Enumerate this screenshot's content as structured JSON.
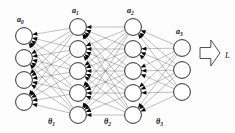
{
  "figure": {
    "background_color": "#fdfdfd",
    "node_fill": "#ffffff",
    "node_stroke": "#1a1a1a",
    "edge_color": "#4a4a4a",
    "arrowhead_color": "#0a0a0a",
    "loss_arrow_fill": "#ffffff",
    "loss_arrow_stroke": "#3a3a3a"
  },
  "layers": [
    {
      "id": "layer-0",
      "label": "a",
      "subscript": "0",
      "label_full": "a0",
      "node_count": 4,
      "cx": 24,
      "cy_start": 36,
      "cy_step": 22,
      "radius": 8.4,
      "label_x": 17,
      "label_y": 22,
      "role": "input-layer"
    },
    {
      "id": "layer-1",
      "label": "a",
      "subscript": "1",
      "label_full": "a1",
      "node_count": 5,
      "cx": 78,
      "cy_start": 27,
      "cy_step": 22,
      "radius": 8.4,
      "label_x": 72,
      "label_y": 13,
      "role": "hidden-layer-1"
    },
    {
      "id": "layer-2",
      "label": "a",
      "subscript": "2",
      "label_full": "a2",
      "node_count": 5,
      "cx": 133,
      "cy_start": 27,
      "cy_step": 22,
      "radius": 8.4,
      "label_x": 127,
      "label_y": 13,
      "role": "hidden-layer-2"
    },
    {
      "id": "layer-3",
      "label": "a",
      "subscript": "3",
      "label_full": "a3",
      "node_count": 3,
      "cx": 182,
      "cy_start": 48,
      "cy_step": 22,
      "radius": 8.4,
      "label_x": 176,
      "label_y": 34,
      "role": "output-layer"
    }
  ],
  "weights": [
    {
      "id": "theta-1",
      "label": "θ",
      "subscript": "1",
      "label_full": "θ1",
      "x": 48,
      "y": 124,
      "between": [
        "layer-0",
        "layer-1"
      ]
    },
    {
      "id": "theta-2",
      "label": "θ",
      "subscript": "2",
      "label_full": "θ2",
      "x": 104,
      "y": 124,
      "between": [
        "layer-1",
        "layer-2"
      ]
    },
    {
      "id": "theta-3",
      "label": "θ",
      "subscript": "3",
      "label_full": "θ3",
      "x": 156,
      "y": 124,
      "between": [
        "layer-2",
        "layer-3"
      ]
    }
  ],
  "loss": {
    "id": "loss-arrow",
    "label": "L",
    "label_x": 225,
    "label_y": 58,
    "arrow_x": 200,
    "arrow_y": 40,
    "arrow_w": 20,
    "arrow_h": 26,
    "direction": "right",
    "icon": "block-arrow-right-icon"
  },
  "edges": {
    "connection_style": "fully-connected",
    "arrow_direction": "backward",
    "arrowhead_note": "solid triangles point left toward the preceding layer",
    "arrowhead_size": 5.0
  }
}
